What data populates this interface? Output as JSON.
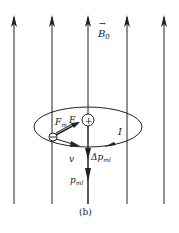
{
  "labels": {
    "field": "B",
    "field_sub": "0",
    "current": "I",
    "force_m": "F",
    "force_m_sub": "m",
    "force_e": "F",
    "force_e_sub": "e",
    "velocity": "v",
    "delta_p": "Δp",
    "delta_p_sub": "ml",
    "p": "p",
    "p_sub": "ml",
    "nucleus": "+",
    "electron": "−",
    "caption": "(b)"
  },
  "colors": {
    "line": "#222222",
    "background": "#ffffff"
  }
}
